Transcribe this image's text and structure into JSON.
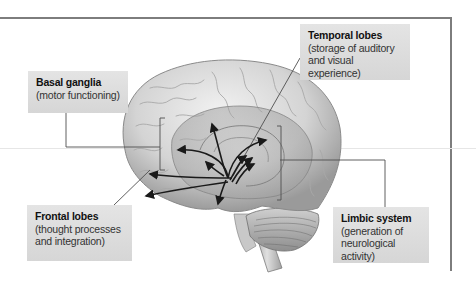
{
  "diagram": {
    "type": "anatomical-labeled-illustration",
    "colors": {
      "frame": "#7d7d7d",
      "label_background": "#dcdcdc",
      "leader_line": "#555555",
      "arrow": "#1a1a1a",
      "brain_base": "#d9d9d9",
      "brain_shadow": "#8c8c8c",
      "limbic_overlay": "#a9a9a9"
    },
    "labels": [
      {
        "id": "basal",
        "title": "Basal ganglia",
        "description": "(motor functioning)"
      },
      {
        "id": "temporal",
        "title": "Temporal lobes",
        "description": "(storage of auditory and visual experience)",
        "lines": [
          "(storage of auditory",
          "and visual experience)"
        ]
      },
      {
        "id": "frontal",
        "title": "Frontal lobes",
        "description": "(thought processes and integration)",
        "lines": [
          "(thought processes",
          "and integration)"
        ]
      },
      {
        "id": "limbic",
        "title": "Limbic system",
        "description": "(generation of neurological activity)",
        "lines": [
          "(generation of",
          "neurological activity)"
        ]
      }
    ]
  }
}
